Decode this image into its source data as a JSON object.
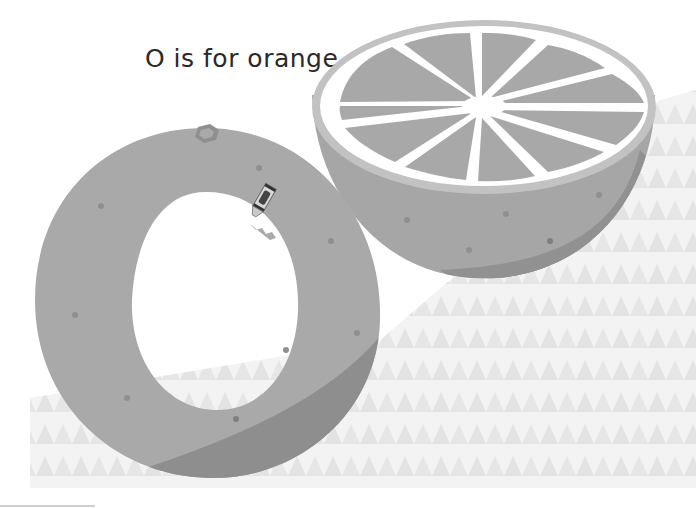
{
  "page": {
    "caption": "O is for orange.",
    "letter": "O",
    "word": "orange"
  },
  "illustration": {
    "subjects": [
      "letter-o-orange",
      "half-orange-slice",
      "crayon",
      "triangle-pattern-background"
    ],
    "colors": {
      "orange_body": "#a9a9a9",
      "orange_shadow": "#8e8e8e",
      "orange_dot": "#909090",
      "stem": "#9b9b9b",
      "slice_rim": "#c4c4c4",
      "pith": "#ffffff",
      "segment": "#a8a8a8",
      "pattern_light": "#f3f3f3",
      "pattern_dark": "#e4e4e4",
      "text": "#2a2a2a"
    }
  }
}
